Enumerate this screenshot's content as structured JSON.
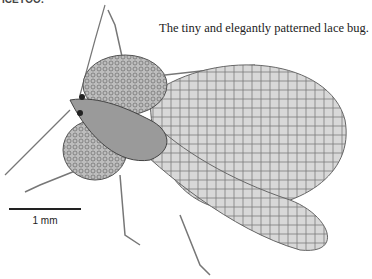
{
  "caption": "The tiny and elegantly patterned lace bug.",
  "top_fragment": "ICEYOO.",
  "scale_bar": {
    "label": "1 mm"
  },
  "illustration": {
    "subject": "lace bug",
    "style": "pen-and-ink stipple drawing, grayscale"
  }
}
